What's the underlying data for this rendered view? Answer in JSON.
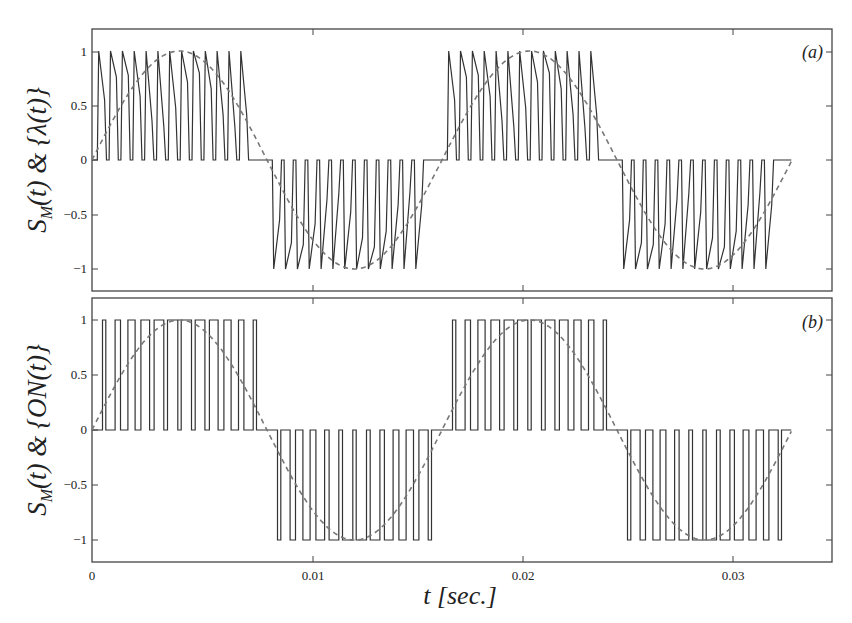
{
  "chart_data": [
    {
      "type": "line",
      "panel_tag": "(a)",
      "ylabel": "S_M(t) & {λ(t)}",
      "ylabel_parts": {
        "main": "S",
        "sub": "M",
        "rest": "(t) & {λ(t)}"
      },
      "xlabel": "",
      "xlim": [
        0,
        0.0333
      ],
      "ylim": [
        -1.2,
        1.2
      ],
      "yticks": [
        1,
        0.5,
        0,
        -0.5,
        -1
      ],
      "ytick_labels": [
        "1",
        "0.5",
        "0",
        "−0.5",
        "−1"
      ],
      "xticks": [
        0.01,
        0.02,
        0.03
      ],
      "series": [
        {
          "name": "S_M(t) modulated switching signal (trapezoidal PWM pulses)",
          "style": "solid",
          "color": "#333333",
          "pulses_per_half_cycle": 13,
          "amplitude": 1
        },
        {
          "name": "λ(t) reference sinusoid",
          "style": "dashed",
          "color": "#777777",
          "frequency_hz": 60,
          "amplitude": 1
        }
      ],
      "grid": false
    },
    {
      "type": "line",
      "panel_tag": "(b)",
      "ylabel": "S_M(t) & {ON(t)}",
      "ylabel_parts": {
        "main": "S",
        "sub": "M",
        "rest": "(t) & {ON(t)}"
      },
      "xlabel": "t [sec.]",
      "xlim": [
        0,
        0.0333
      ],
      "ylim": [
        -1.2,
        1.2
      ],
      "yticks": [
        1,
        0.5,
        0,
        -0.5,
        -1
      ],
      "ytick_labels": [
        "1",
        "0.5",
        "0",
        "−0.5",
        "−1"
      ],
      "xticks": [
        0,
        0.01,
        0.02,
        0.03
      ],
      "xtick_labels": [
        "0",
        "0.01",
        "0.02",
        "0.03"
      ],
      "series": [
        {
          "name": "S_M(t) ON-state rectangular PWM pulses",
          "style": "solid",
          "color": "#333333",
          "pulses_per_half_cycle": 12,
          "amplitude": 1
        },
        {
          "name": "reference sinusoid",
          "style": "dashed",
          "color": "#777777",
          "frequency_hz": 60,
          "amplitude": 1
        }
      ],
      "grid": false
    }
  ],
  "labels": {
    "panel_a": "(a)",
    "panel_b": "(b)",
    "ylabel_a_rest": "(t) & {λ(t)}",
    "ylabel_b_rest": "(t) & {ON(t)}",
    "ylabel_main": "S",
    "ylabel_sub": "M",
    "xlabel": "t [sec.]",
    "yt": [
      "1",
      "0.5",
      "0",
      "−0.5",
      "−1"
    ],
    "xt": [
      "0",
      "0.01",
      "0.02",
      "0.03"
    ]
  }
}
